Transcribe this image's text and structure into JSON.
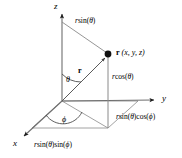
{
  "figure": {
    "type": "spherical-coordinates-diagram",
    "background_color": "#ffffff",
    "line_color": "#6b6b6b",
    "text_color": "#000000",
    "point_color": "#000000"
  },
  "axes": {
    "z_label": "z",
    "y_label": "y",
    "x_label": "x"
  },
  "point": {
    "vector_symbol": "r",
    "coordinates_text": " (x, y, z)"
  },
  "vector": {
    "label": "r"
  },
  "angles": {
    "theta": "θ",
    "phi": "ϕ"
  },
  "labels": {
    "r_sin_theta": {
      "r": "r",
      "fn": "sin(",
      "arg": "θ",
      "close": ")"
    },
    "r_cos_theta": {
      "r": "r",
      "fn": "cos(",
      "arg": "θ",
      "close": ")"
    },
    "r_sin_theta_cos_phi": {
      "r": "r",
      "fn1": "sin(",
      "arg1": "θ",
      "close1": ")",
      "fn2": "cos(",
      "arg2": "ϕ",
      "close2": ")"
    },
    "r_sin_theta_sin_phi": {
      "r": "r",
      "fn1": "sin(",
      "arg1": "θ",
      "close1": ")",
      "fn2": "sin(",
      "arg2": "ϕ",
      "close2": ")"
    }
  },
  "geometry": {
    "origin": "62,101",
    "z_axis_tip": "62,12",
    "y_axis_tip": "155,100",
    "x_axis_tip": "22,138",
    "point_xy": "108,54",
    "projection_xy": "108,128"
  }
}
